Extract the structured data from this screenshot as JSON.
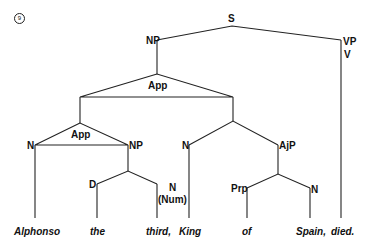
{
  "example_number": "9",
  "nodes": {
    "s": "S",
    "np_top": "NP",
    "vp": "VP",
    "v": "V",
    "app_top": "App",
    "app_inner": "App",
    "n_alphonso": "N",
    "np_inner": "NP",
    "n_king": "N",
    "ajp": "AjP",
    "d": "D",
    "n_num": "N",
    "num": "(Num)",
    "prp": "Prp",
    "n_spain": "N"
  },
  "words": [
    "Alphonso",
    "the",
    "third,",
    "King",
    "of",
    "Spain,",
    "died."
  ]
}
